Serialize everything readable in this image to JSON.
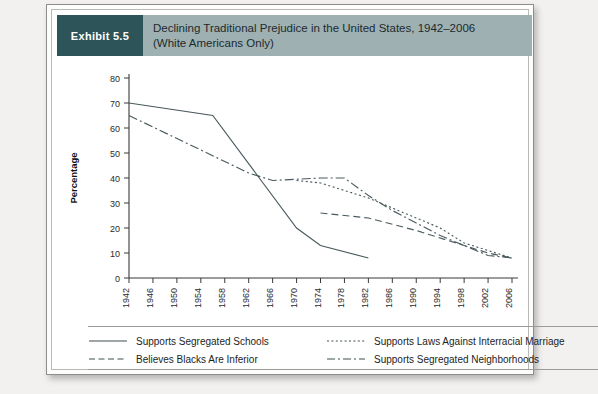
{
  "exhibit": {
    "badge": "Exhibit 5.5",
    "title_line1": "Declining Traditional Prejudice in the United States, 1942–2006",
    "title_line2": "(White Americans Only)",
    "badge_color": "#2c5459",
    "header_color": "#9fb0b2"
  },
  "chart_data": {
    "type": "line",
    "title": "Declining Traditional Prejudice in the United States, 1942–2006 (White Americans Only)",
    "xlabel": "",
    "ylabel": "Percentage",
    "xlim": [
      1942,
      2006
    ],
    "ylim": [
      0,
      80
    ],
    "grid": false,
    "legend_position": "below",
    "categories": [
      1942,
      1946,
      1950,
      1954,
      1958,
      1962,
      1966,
      1970,
      1974,
      1978,
      1982,
      1986,
      1990,
      1994,
      1998,
      2002,
      2006
    ],
    "xticklabels": [
      "1942",
      "1946",
      "1950",
      "1954",
      "1958",
      "1962",
      "1966",
      "1970",
      "1974",
      "1978",
      "1982",
      "1986",
      "1990",
      "1994",
      "1998",
      "2002",
      "2006"
    ],
    "yticklabels": [
      "0",
      "10",
      "20",
      "30",
      "40",
      "50",
      "60",
      "70",
      "80"
    ],
    "yticks": [
      0,
      10,
      20,
      30,
      40,
      50,
      60,
      70,
      80
    ],
    "series": [
      {
        "name": "Supports Segregated Schools",
        "style": "solid",
        "points": [
          [
            1942,
            70
          ],
          [
            1956,
            65
          ],
          [
            1970,
            20
          ],
          [
            1974,
            13
          ],
          [
            1982,
            8
          ]
        ]
      },
      {
        "name": "Believes Blacks Are Inferior",
        "style": "dashed",
        "points": [
          [
            1974,
            26
          ],
          [
            1982,
            24
          ],
          [
            1990,
            19
          ],
          [
            1998,
            13
          ],
          [
            2002,
            10
          ],
          [
            2006,
            8
          ]
        ]
      },
      {
        "name": "Supports Laws Against Interracial Marriage",
        "style": "dotted",
        "points": [
          [
            1970,
            39
          ],
          [
            1974,
            38
          ],
          [
            1978,
            35
          ],
          [
            1982,
            32
          ],
          [
            1986,
            28
          ],
          [
            1990,
            24
          ],
          [
            1994,
            20
          ],
          [
            1998,
            14
          ],
          [
            2002,
            11
          ],
          [
            2006,
            8
          ]
        ]
      },
      {
        "name": "Supports Segregated Neighborhoods",
        "style": "dashdot",
        "points": [
          [
            1942,
            65
          ],
          [
            1962,
            42
          ],
          [
            1966,
            39
          ],
          [
            1974,
            40
          ],
          [
            1978,
            40
          ],
          [
            1982,
            33
          ],
          [
            1986,
            27
          ],
          [
            1990,
            22
          ],
          [
            1994,
            17
          ],
          [
            1998,
            13
          ],
          [
            2002,
            9
          ],
          [
            2006,
            8
          ]
        ]
      }
    ]
  },
  "legend": {
    "items": [
      {
        "label": "Supports Segregated Schools",
        "style": "solid"
      },
      {
        "label": "Supports Laws Against Interracial Marriage",
        "style": "dotted"
      },
      {
        "label": "Believes Blacks Are Inferior",
        "style": "dashed"
      },
      {
        "label": "Supports Segregated Neighborhoods",
        "style": "dashdot"
      }
    ]
  }
}
